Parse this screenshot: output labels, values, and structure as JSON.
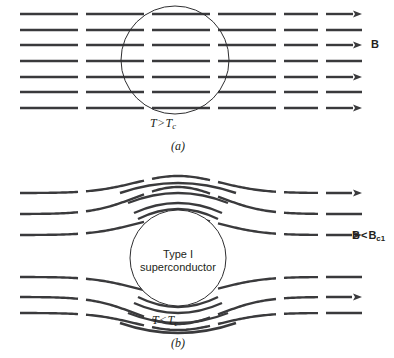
{
  "figure": {
    "title_semantic": "meissner-effect-magnetic-field-lines",
    "background_color": "#ffffff",
    "line_color": "#3a3a3c",
    "text_color": "#231f20",
    "width": 394,
    "height": 358
  },
  "panel_a": {
    "caption": "(a)",
    "condition_label": {
      "variable": "T",
      "relation": ">",
      "reference": "T",
      "reference_subscript": "c",
      "full_text": "T > Tc"
    },
    "field_label": {
      "text": "B",
      "subscript": "",
      "full_text": "B"
    },
    "circle": {
      "cx": 175,
      "cy": 60,
      "r": 54
    },
    "description": "Uniform straight magnetic field lines pass undisturbed through the sphere above the critical temperature",
    "field_line_rows": [
      {
        "y": 14,
        "has_arrow": true
      },
      {
        "y": 30,
        "has_arrow": false
      },
      {
        "y": 45,
        "has_arrow": true
      },
      {
        "y": 61,
        "has_arrow": false
      },
      {
        "y": 77,
        "has_arrow": true
      },
      {
        "y": 92,
        "has_arrow": false
      },
      {
        "y": 108,
        "has_arrow": true
      }
    ],
    "dash_segments": [
      [
        20,
        78
      ],
      [
        86,
        144
      ],
      [
        152,
        210
      ],
      [
        218,
        276
      ],
      [
        284,
        318
      ],
      [
        326,
        362
      ]
    ],
    "arrow_tip_x": 362,
    "line_width": 2.4
  },
  "panel_b": {
    "caption": "(b)",
    "condition_label": {
      "variable": "T",
      "relation": "<",
      "reference": "T",
      "reference_subscript": "c",
      "full_text": "T < Tc"
    },
    "field_label": {
      "text": "B",
      "relation": "<",
      "reference": "B",
      "reference_subscript": "c1",
      "full_text": "B < Bc1"
    },
    "sphere_label": {
      "line1": "Type I",
      "line2": "superconductor"
    },
    "circle": {
      "cx": 178,
      "cy": 258,
      "r": 48
    },
    "description": "Magnetic field lines are expelled and bend around the Type I superconductor below the critical temperature (Meissner effect)",
    "field_line_rows": [
      {
        "y": 193,
        "has_arrow": true,
        "deflection": -17
      },
      {
        "y": 214,
        "has_arrow": false,
        "deflection": -27
      },
      {
        "y": 235,
        "has_arrow": true,
        "deflection": -18
      },
      {
        "y": 277,
        "has_arrow": false,
        "deflection": 18
      },
      {
        "y": 297,
        "has_arrow": true,
        "deflection": 27
      },
      {
        "y": 313,
        "has_arrow": false,
        "deflection": 17
      }
    ],
    "arc_lines_top": [
      {
        "y_apex": 180,
        "spread": 58
      },
      {
        "y_apex": 190,
        "spread": 50
      },
      {
        "y_apex": 200,
        "spread": 44
      },
      {
        "y_apex": 206,
        "spread": 40
      }
    ],
    "arc_lines_bottom": [
      {
        "y_apex": 336,
        "spread": 58
      },
      {
        "y_apex": 326,
        "spread": 50
      },
      {
        "y_apex": 316,
        "spread": 44
      },
      {
        "y_apex": 310,
        "spread": 40
      }
    ],
    "dash_segments": [
      [
        20,
        78
      ],
      [
        86,
        144
      ],
      [
        152,
        210
      ],
      [
        218,
        276
      ],
      [
        284,
        318
      ],
      [
        326,
        362
      ]
    ],
    "arrow_tip_x": 362,
    "line_width": 2.4
  },
  "labels_positions": {
    "panel_a_condition": {
      "x": 150,
      "y": 117
    },
    "panel_a_caption": {
      "x": 178,
      "y": 140
    },
    "panel_a_field": {
      "x": 371,
      "y": 38
    },
    "panel_b_condition": {
      "x": 152,
      "y": 314
    },
    "panel_b_caption": {
      "x": 178,
      "y": 337
    },
    "panel_b_field": {
      "x": 352,
      "y": 229
    },
    "panel_b_sphere": {
      "x": 178,
      "y": 248
    }
  }
}
